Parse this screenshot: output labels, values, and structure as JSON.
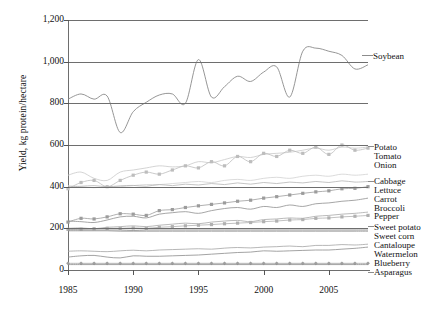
{
  "chart_data": {
    "type": "line",
    "title": "",
    "xlabel": "",
    "ylabel": "Yield, kg protein/hectare",
    "xlim": [
      1985,
      2008
    ],
    "ylim": [
      0,
      1200
    ],
    "ytick_labels": [
      "0",
      "200",
      "400",
      "600",
      "800",
      "1,000",
      "1,200"
    ],
    "ytick_values": [
      0,
      200,
      400,
      600,
      800,
      1000,
      1200
    ],
    "xtick_labels": [
      "1985",
      "1990",
      "1995",
      "2000",
      "2005"
    ],
    "xtick_values": [
      1985,
      1990,
      1995,
      2000,
      2005
    ],
    "grid": true,
    "legend_position": "right-of-axes-labels",
    "x": [
      1985,
      1986,
      1987,
      1988,
      1989,
      1990,
      1991,
      1992,
      1993,
      1994,
      1995,
      1996,
      1997,
      1998,
      1999,
      2000,
      2001,
      2002,
      2003,
      2004,
      2005,
      2006,
      2007,
      2008
    ],
    "series": [
      {
        "name": "Soybean",
        "color": "#8a8a8a",
        "marker": "none",
        "values": [
          820,
          845,
          820,
          835,
          660,
          760,
          805,
          840,
          845,
          800,
          1010,
          830,
          880,
          930,
          905,
          950,
          975,
          830,
          1050,
          1065,
          1050,
          1030,
          965,
          985
        ]
      },
      {
        "name": "Potato",
        "color": "#c9c9c9",
        "marker": "none",
        "values": [
          455,
          470,
          440,
          430,
          470,
          480,
          490,
          500,
          495,
          500,
          520,
          515,
          530,
          545,
          540,
          555,
          560,
          565,
          575,
          585,
          575,
          590,
          585,
          590
        ]
      },
      {
        "name": "Tomato",
        "color": "#bdbdbd",
        "marker": "square",
        "values": [
          390,
          420,
          430,
          400,
          430,
          455,
          470,
          460,
          480,
          500,
          490,
          520,
          500,
          545,
          520,
          560,
          545,
          575,
          560,
          590,
          555,
          600,
          575,
          585
        ]
      },
      {
        "name": "Onion",
        "color": "#d2d2d2",
        "marker": "none",
        "values": [
          405,
          400,
          395,
          400,
          400,
          405,
          410,
          410,
          415,
          420,
          425,
          420,
          430,
          435,
          430,
          440,
          445,
          440,
          450,
          455,
          450,
          460,
          455,
          460
        ]
      },
      {
        "name": "Cabbage",
        "color": "#b5b5b5",
        "marker": "none",
        "values": [
          400,
          402,
          405,
          400,
          404,
          406,
          402,
          410,
          405,
          412,
          408,
          415,
          410,
          418,
          412,
          420,
          415,
          422,
          418,
          425,
          420,
          428,
          422,
          425
        ]
      },
      {
        "name": "Lettuce",
        "color": "#9c9c9c",
        "marker": "square",
        "values": [
          230,
          248,
          245,
          255,
          270,
          268,
          262,
          285,
          290,
          300,
          308,
          315,
          322,
          330,
          335,
          345,
          352,
          360,
          368,
          375,
          380,
          390,
          392,
          400
        ]
      },
      {
        "name": "Carrot",
        "color": "#8f8f8f",
        "marker": "none",
        "values": [
          235,
          232,
          228,
          240,
          255,
          258,
          250,
          268,
          275,
          280,
          272,
          285,
          295,
          300,
          292,
          305,
          300,
          312,
          305,
          318,
          322,
          330,
          335,
          345
        ]
      },
      {
        "name": "Broccoli",
        "color": "#a8a8a8",
        "marker": "none",
        "values": [
          200,
          202,
          198,
          205,
          208,
          212,
          208,
          215,
          220,
          225,
          222,
          230,
          235,
          238,
          232,
          242,
          245,
          250,
          248,
          258,
          262,
          268,
          272,
          278
        ]
      },
      {
        "name": "Pepper",
        "color": "#b0b0b0",
        "marker": "square",
        "values": [
          195,
          196,
          198,
          200,
          200,
          202,
          200,
          205,
          208,
          212,
          215,
          218,
          222,
          225,
          228,
          232,
          235,
          240,
          242,
          248,
          250,
          255,
          258,
          262
        ]
      },
      {
        "name": "Sweet potato",
        "color": "#7d7d7d",
        "marker": "none",
        "values": [
          192,
          192,
          192,
          192,
          192,
          190,
          192,
          192,
          192,
          192,
          192,
          192,
          192,
          192,
          192,
          192,
          192,
          192,
          192,
          192,
          192,
          192,
          192,
          192
        ]
      },
      {
        "name": "Sweet corn",
        "color": "#999999",
        "marker": "none",
        "values": [
          188,
          188,
          188,
          188,
          186,
          186,
          186,
          186,
          186,
          186,
          186,
          186,
          186,
          186,
          186,
          186,
          186,
          186,
          186,
          186,
          186,
          186,
          186,
          186
        ]
      },
      {
        "name": "Cantaloupe",
        "color": "#a5a5a5",
        "marker": "none",
        "values": [
          90,
          92,
          90,
          88,
          92,
          95,
          92,
          96,
          98,
          100,
          102,
          100,
          105,
          108,
          106,
          110,
          112,
          115,
          112,
          118,
          118,
          122,
          120,
          124
        ]
      },
      {
        "name": "Watermelon",
        "color": "#8b8b8b",
        "marker": "none",
        "values": [
          62,
          68,
          70,
          62,
          58,
          68,
          66,
          66,
          68,
          70,
          72,
          76,
          80,
          84,
          86,
          92,
          90,
          92,
          94,
          96,
          96,
          100,
          104,
          110
        ]
      },
      {
        "name": "Blueberry",
        "color": "#9e9e9e",
        "marker": "diamond",
        "values": [
          32,
          32,
          32,
          32,
          32,
          32,
          32,
          32,
          32,
          32,
          32,
          32,
          32,
          32,
          32,
          32,
          32,
          32,
          32,
          32,
          32,
          32,
          32,
          32
        ]
      },
      {
        "name": "Asparagus",
        "color": "#8a8a8a",
        "marker": "none",
        "values": [
          26,
          26,
          26,
          26,
          26,
          26,
          26,
          26,
          26,
          26,
          26,
          26,
          26,
          26,
          26,
          26,
          26,
          26,
          26,
          26,
          26,
          26,
          26,
          26
        ]
      }
    ]
  },
  "axis": {
    "ylabel": "Yield, kg protein/hectare",
    "yticks": [
      "1,200",
      "1,000",
      "800",
      "600",
      "400",
      "200",
      "0"
    ],
    "xticks": [
      "1985",
      "1990",
      "1995",
      "2000",
      "2005"
    ]
  },
  "legend": {
    "soybean": "Soybean",
    "items": [
      "Potato",
      "Tomato",
      "Onion",
      "Cabbage",
      "Lettuce",
      "Carrot",
      "Broccoli",
      "Pepper",
      "Sweet potato",
      "Sweet corn",
      "Cantaloupe",
      "Watermelon",
      "Blueberry",
      "Asparagus"
    ]
  },
  "colors": {
    "axis": "#6e6e6e",
    "grid": "#6e6e6e",
    "text": "#111111",
    "soybean_line": "#8a8a8a"
  }
}
